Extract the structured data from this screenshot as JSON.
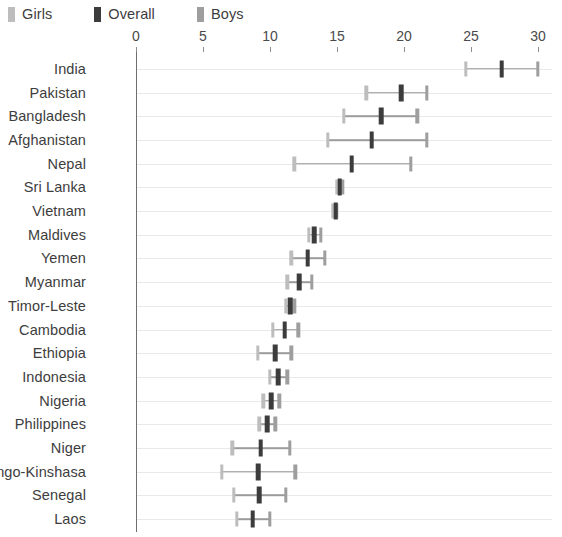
{
  "legend": {
    "items": [
      {
        "label": "Girls",
        "color": "#bdbdbd",
        "key": "girls"
      },
      {
        "label": "Overall",
        "color": "#3c3c3c",
        "key": "overall"
      },
      {
        "label": "Boys",
        "color": "#9e9e9e",
        "key": "boys"
      }
    ]
  },
  "chart_data": {
    "type": "scatter",
    "title": "",
    "subtitle": "",
    "xlabel": "",
    "ylabel": "",
    "xlim": [
      0,
      30
    ],
    "ylim": null,
    "grid": true,
    "legend_position": "top-left",
    "xticks": [
      0,
      5,
      10,
      15,
      20,
      25,
      30
    ],
    "xtick_labels": [
      "0",
      "5",
      "10",
      "15",
      "20",
      "25",
      "30"
    ],
    "categories": [
      "India",
      "Pakistan",
      "Bangladesh",
      "Afghanistan",
      "Nepal",
      "Sri Lanka",
      "Vietnam",
      "Maldives",
      "Yemen",
      "Myanmar",
      "Timor-Leste",
      "Cambodia",
      "Ethiopia",
      "Indonesia",
      "Nigeria",
      "Philippines",
      "Niger",
      "Congo-Kinshasa",
      "Senegal",
      "Laos"
    ],
    "series": [
      {
        "name": "Girls",
        "values": [
          24.6,
          17.2,
          15.5,
          14.3,
          11.8,
          15.0,
          14.7,
          12.9,
          11.6,
          11.3,
          11.2,
          10.2,
          9.1,
          10.0,
          9.5,
          9.2,
          7.2,
          6.4,
          7.3,
          7.5
        ]
      },
      {
        "name": "Overall",
        "values": [
          27.3,
          19.8,
          18.3,
          17.6,
          16.1,
          15.2,
          14.9,
          13.3,
          12.8,
          12.2,
          11.5,
          11.1,
          10.4,
          10.6,
          10.1,
          9.8,
          9.3,
          9.1,
          9.2,
          8.7
        ]
      },
      {
        "name": "Boys",
        "values": [
          30.0,
          21.7,
          21.0,
          21.7,
          20.5,
          15.4,
          15.0,
          13.8,
          14.1,
          13.1,
          11.8,
          12.1,
          11.6,
          11.3,
          10.7,
          10.4,
          11.5,
          11.9,
          11.2,
          10.0
        ]
      }
    ]
  }
}
